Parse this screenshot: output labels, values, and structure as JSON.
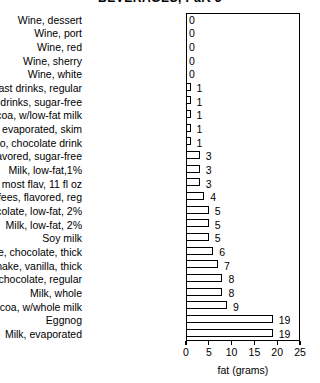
{
  "chart_data": {
    "type": "bar",
    "orientation": "horizontal",
    "title": "BEVERAGES, Part 3",
    "xlabel": "fat (grams)",
    "ylabel": "",
    "xlim": [
      0,
      25
    ],
    "xticks": [
      0,
      5,
      10,
      15,
      20,
      25
    ],
    "xtick_labels": [
      "0",
      "5",
      "10",
      "15",
      "20",
      "25"
    ],
    "grid": false,
    "legend": false,
    "bar_style": "3d-shadow-white-fill",
    "categories": [
      "Wine, dessert",
      "Wine, port",
      "Wine, red",
      "Wine, sherry",
      "Wine, white",
      "Breakfast drinks, regular",
      "Breakfast drinks, sugar-free",
      "Cocoa, w/low-fat milk",
      "Milk, evaporated, skim",
      "Yoo-Hoo, chocolate drink",
      "Coffees, flavored, sugar-free",
      "Milk, low-fat,1%",
      "Slim Fast, most flav, 11 fl oz",
      "Coffees, flavored, reg",
      "Milk, chocolate, low-fat, 2%",
      "Milk, low-fat, 2%",
      "Soy milk",
      "Shake, chocolate, thick",
      "Shake, vanilla, thick",
      "Milk, chocolate, regular",
      "Milk, whole",
      "Cocoa, w/whole milk",
      "Eggnog",
      "Milk, evaporated"
    ],
    "values": [
      0,
      0,
      0,
      0,
      0,
      1,
      1,
      1,
      1,
      1,
      3,
      3,
      3,
      4,
      5,
      5,
      5,
      6,
      7,
      8,
      8,
      9,
      19,
      19
    ],
    "value_labels": [
      "0",
      "0",
      "0",
      "0",
      "0",
      "1",
      "1",
      "1",
      "1",
      "1",
      "3",
      "3",
      "3",
      "4",
      "5",
      "5",
      "5",
      "6",
      "7",
      "8",
      "8",
      "9",
      "19",
      "19"
    ]
  }
}
